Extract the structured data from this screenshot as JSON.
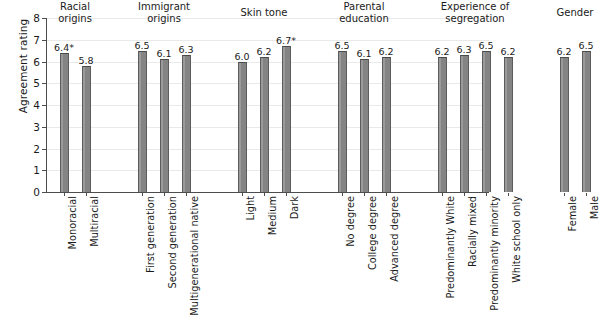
{
  "chart_data": {
    "type": "bar",
    "title": "",
    "xlabel": "",
    "ylabel": "Agreement rating",
    "ylim": [
      0,
      8
    ],
    "ytick_labels": [
      "0",
      "1",
      "2",
      "3",
      "4",
      "5",
      "6",
      "7",
      "8"
    ],
    "grid": true,
    "legend": "none",
    "bar_color": "#8d8d8d",
    "bar_edge_color": "#4a4a4a",
    "groups": [
      {
        "name": "Racial origins",
        "header_lines": [
          "Racial",
          "origins"
        ],
        "categories": [
          "Monoracial",
          "Multiracial"
        ],
        "values": [
          6.4,
          5.8
        ],
        "value_labels": [
          "6.4*",
          "5.8"
        ]
      },
      {
        "name": "Immigrant origins",
        "header_lines": [
          "Immigrant",
          "origins"
        ],
        "categories": [
          "First generation",
          "Second generation",
          "Multigenerational native"
        ],
        "values": [
          6.5,
          6.1,
          6.3
        ],
        "value_labels": [
          "6.5",
          "6.1",
          "6.3"
        ]
      },
      {
        "name": "Skin tone",
        "header_lines": [
          "Skin tone"
        ],
        "categories": [
          "Light",
          "Medium",
          "Dark"
        ],
        "values": [
          6.0,
          6.2,
          6.7
        ],
        "value_labels": [
          "6.0",
          "6.2",
          "6.7*"
        ]
      },
      {
        "name": "Parental education",
        "header_lines": [
          "Parental",
          "education"
        ],
        "categories": [
          "No degree",
          "College degree",
          "Advanced degree"
        ],
        "values": [
          6.5,
          6.1,
          6.2
        ],
        "value_labels": [
          "6.5",
          "6.1",
          "6.2"
        ]
      },
      {
        "name": "Experience of segregation",
        "header_lines": [
          "Experience of",
          "segregation"
        ],
        "categories": [
          "Predominantly White",
          "Racially mixed",
          "Predominantly minority",
          "White school only"
        ],
        "values": [
          6.2,
          6.3,
          6.5,
          6.2
        ],
        "value_labels": [
          "6.2",
          "6.3",
          "6.5",
          "6.2"
        ]
      },
      {
        "name": "Gender",
        "header_lines": [
          "Gender"
        ],
        "categories": [
          "Female",
          "Male"
        ],
        "values": [
          6.2,
          6.5
        ],
        "value_labels": [
          "6.2",
          "6.5"
        ]
      }
    ]
  }
}
